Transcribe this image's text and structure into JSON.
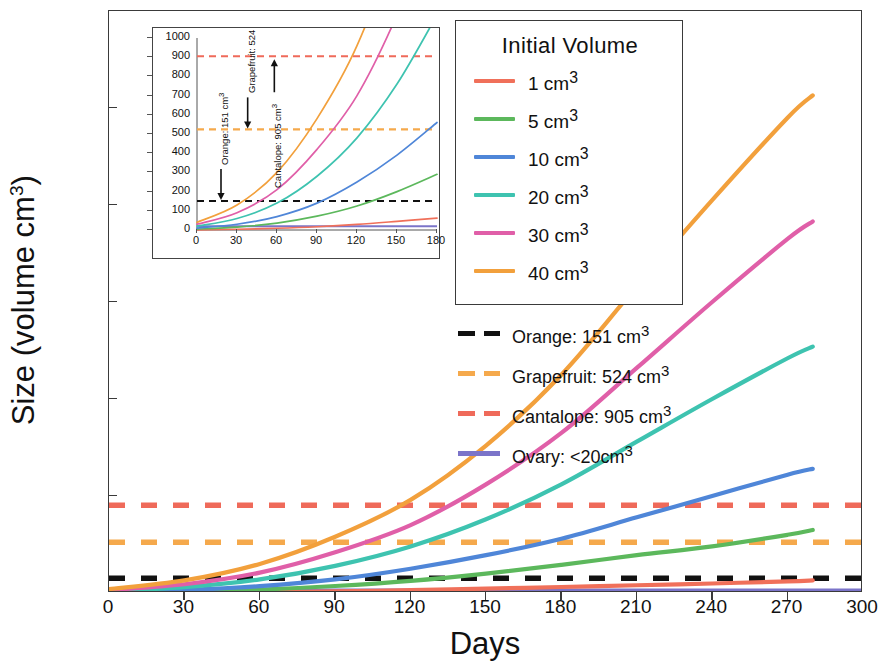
{
  "chart_data": {
    "type": "line",
    "title": "",
    "xlabel": "Days",
    "ylabel": "Size (volume cm3)",
    "ylabel_html": "Size (volume cm<sup>3</sup>)",
    "xlim": [
      0,
      300
    ],
    "ylim": [
      0,
      6000
    ],
    "xticks": [
      0,
      30,
      60,
      90,
      120,
      150,
      180,
      210,
      240,
      270,
      300
    ],
    "yticks": [
      0,
      1000,
      2000,
      3000,
      4000,
      5000,
      6000
    ],
    "grid": false,
    "legend_position": "upper-right-inside-box",
    "legend_title": "Initial  Volume",
    "series": [
      {
        "name": "1 cm3",
        "label_html": "1 cm<sup>3</sup>",
        "color": "#f0705a",
        "initial_volume": 1,
        "x": [
          0,
          30,
          60,
          90,
          120,
          150,
          180,
          210,
          240,
          270,
          280
        ],
        "y": [
          1,
          4,
          9,
          17,
          29,
          45,
          62,
          80,
          98,
          120,
          130
        ]
      },
      {
        "name": "5 cm3",
        "label_html": "5 cm<sup>3</sup>",
        "color": "#5cb85c",
        "initial_volume": 5,
        "x": [
          0,
          30,
          60,
          90,
          120,
          150,
          180,
          210,
          240,
          270,
          280
        ],
        "y": [
          5,
          15,
          36,
          72,
          125,
          200,
          290,
          390,
          480,
          600,
          650
        ]
      },
      {
        "name": "10 cm3",
        "label_html": "10 cm<sup>3</sup>",
        "color": "#4f86d8",
        "initial_volume": 10,
        "x": [
          0,
          30,
          60,
          90,
          120,
          150,
          180,
          210,
          240,
          270,
          280
        ],
        "y": [
          10,
          30,
          70,
          140,
          250,
          390,
          560,
          780,
          1000,
          1220,
          1280
        ]
      },
      {
        "name": "20 cm3",
        "label_html": "20 cm<sup>3</sup>",
        "color": "#3ec3b0",
        "initial_volume": 20,
        "x": [
          0,
          30,
          60,
          90,
          120,
          150,
          180,
          210,
          240,
          270,
          280
        ],
        "y": [
          20,
          60,
          140,
          280,
          480,
          760,
          1120,
          1560,
          2000,
          2420,
          2540
        ]
      },
      {
        "name": "30 cm3",
        "label_html": "30 cm<sup>3</sup>",
        "color": "#e05fa8",
        "initial_volume": 30,
        "x": [
          0,
          30,
          60,
          90,
          120,
          150,
          180,
          210,
          240,
          270,
          280
        ],
        "y": [
          30,
          90,
          210,
          420,
          700,
          1120,
          1650,
          2320,
          3000,
          3650,
          3830
        ]
      },
      {
        "name": "40 cm3",
        "label_html": "40 cm<sup>3</sup>",
        "color": "#f2a03c",
        "initial_volume": 40,
        "x": [
          0,
          30,
          60,
          90,
          120,
          150,
          180,
          210,
          240,
          270,
          280
        ],
        "y": [
          40,
          130,
          300,
          580,
          960,
          1520,
          2250,
          3160,
          4050,
          4900,
          5130
        ]
      }
    ],
    "reference_lines": [
      {
        "name": "Orange",
        "label_html": "Orange: 151 cm<sup>3</sup>",
        "value": 151,
        "color": "#111111",
        "style": "dashed"
      },
      {
        "name": "Grapefruit",
        "label_html": "Grapefruit: 524 cm<sup>3</sup>",
        "value": 524,
        "color": "#f5a94c",
        "style": "dashed"
      },
      {
        "name": "Cantalope",
        "label_html": "Cantalope:  905 cm<sup>3</sup>",
        "value": 905,
        "color": "#ef6a5a",
        "style": "dashed"
      },
      {
        "name": "Ovary",
        "label_html": "Ovary: &lt;20cm<sup>3</sup>",
        "value": 20,
        "color": "#7b74c9",
        "style": "solid"
      }
    ],
    "inset": {
      "xlim": [
        0,
        180
      ],
      "ylim": [
        0,
        1000
      ],
      "xticks": [
        0,
        30,
        60,
        90,
        120,
        150,
        180
      ],
      "yticks": [
        0,
        100,
        200,
        300,
        400,
        500,
        600,
        700,
        800,
        900,
        1000
      ],
      "annotations": [
        {
          "text_html": "Orange: 151 cm<sup>3</sup>",
          "arrow": "down",
          "target_value": 151,
          "x_day": 18
        },
        {
          "text_html": "Grapefruit: 524 cm<sup>3</sup>",
          "arrow": "down",
          "target_value": 524,
          "x_day": 38
        },
        {
          "text_html": "Cantalope: 905 cm<sup>3</sup>",
          "arrow": "up",
          "target_value": 905,
          "x_day": 58
        }
      ]
    }
  },
  "axis": {
    "ylabel_text": "Size (volume cm",
    "ylabel_sup": "3",
    "ylabel_tail": ")",
    "xlabel_text": "Days"
  },
  "legend": {
    "title": "Initial  Volume"
  }
}
